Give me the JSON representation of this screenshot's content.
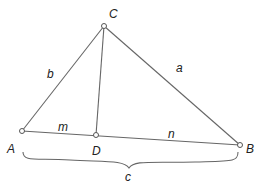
{
  "diagram": {
    "type": "triangle-with-altitude",
    "points": {
      "A": {
        "label": "A",
        "x": 22,
        "y": 131
      },
      "B": {
        "label": "B",
        "x": 240,
        "y": 145
      },
      "C": {
        "label": "C",
        "x": 104,
        "y": 26
      },
      "D": {
        "label": "D",
        "x": 96,
        "y": 135
      }
    },
    "sides": {
      "a": {
        "label": "a",
        "from": "C",
        "to": "B"
      },
      "b": {
        "label": "b",
        "from": "A",
        "to": "C"
      },
      "m": {
        "label": "m",
        "from": "A",
        "to": "D"
      },
      "n": {
        "label": "n",
        "from": "D",
        "to": "B"
      },
      "c": {
        "label": "c",
        "from": "A",
        "to": "B",
        "style": "brace"
      }
    },
    "altitude": {
      "from": "C",
      "to": "D"
    },
    "colors": {
      "line": "#666666",
      "text": "#222222"
    }
  }
}
